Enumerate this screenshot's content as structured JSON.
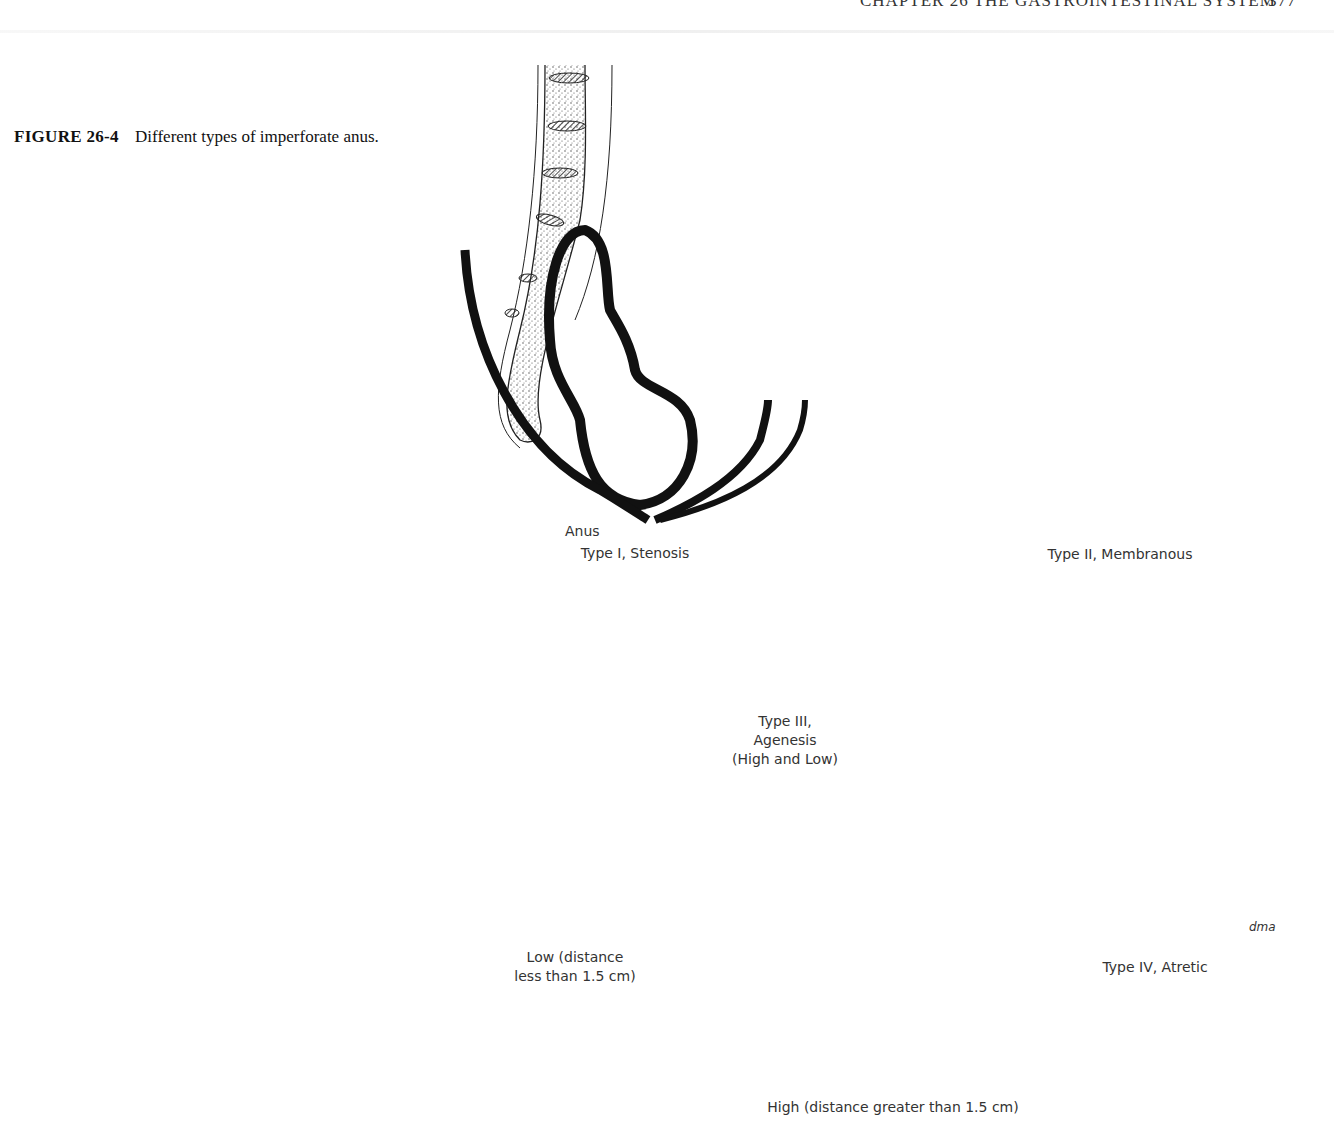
{
  "running_head": {
    "chapter": "CHAPTER 26   THE GASTROINTESTINAL SYSTEM",
    "page_number": "377"
  },
  "figure": {
    "number": "FIGURE 26-4",
    "caption": "Different types of imperforate anus."
  },
  "panels": [
    {
      "id": "type1",
      "label": "Type I, Stenosis",
      "annotation": "Anus"
    },
    {
      "id": "type2",
      "label": "Type II, Membranous"
    },
    {
      "id": "type3",
      "label_line1": "Type III,",
      "label_line2": "Agenesis",
      "label_line3": "(High and Low)"
    },
    {
      "id": "type3-low",
      "label_line1": "Low (distance",
      "label_line2": "less than 1.5 cm)"
    },
    {
      "id": "type3-high",
      "label": "High (distance greater than 1.5 cm)"
    },
    {
      "id": "type4",
      "label": "Type IV, Atretic"
    }
  ],
  "artist_signature": "dma"
}
